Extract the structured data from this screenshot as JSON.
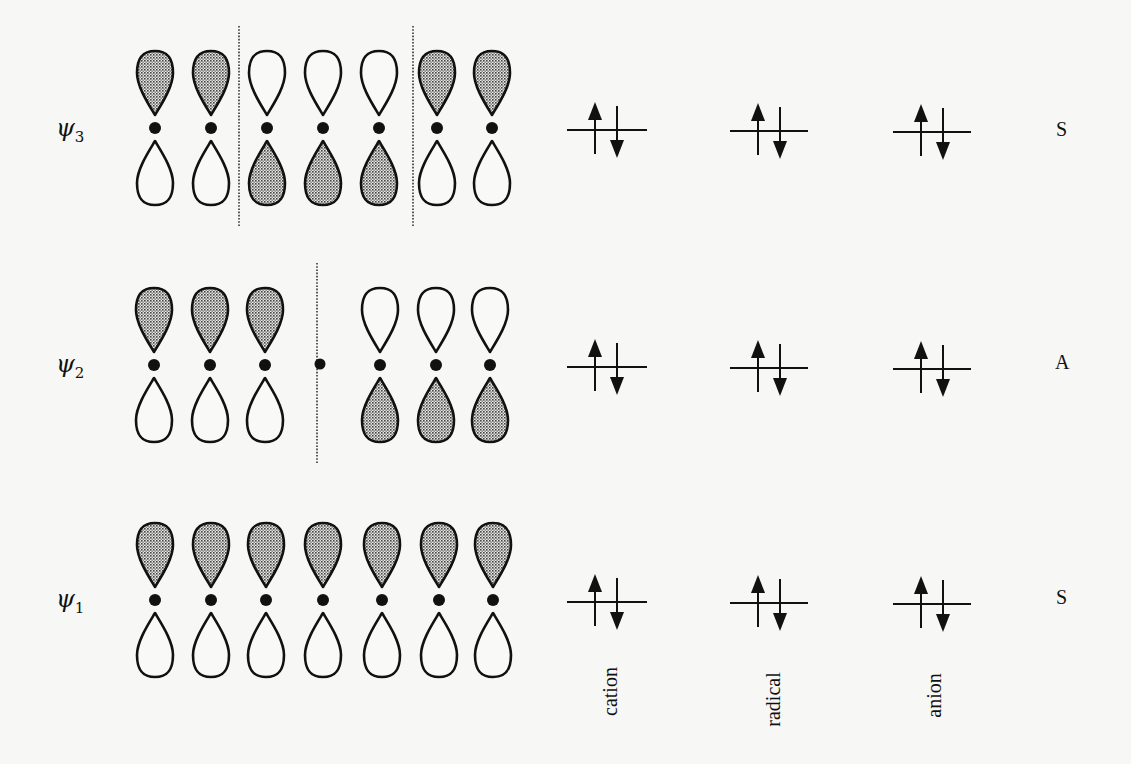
{
  "figure": {
    "colors": {
      "background": "#f7f7f5",
      "stroke": "#111111",
      "shaded_fill": "#b5b5b5"
    }
  },
  "orbitals": [
    {
      "id": "psi3",
      "label": "ψ",
      "subscript": "3",
      "symmetry": "S",
      "y_center": 128,
      "atom_x": [
        155,
        211,
        267,
        323,
        379,
        437,
        492
      ],
      "upper_shaded": [
        true,
        true,
        false,
        false,
        false,
        true,
        true
      ],
      "nodes_x": [
        239,
        413
      ],
      "node_dot_x": null,
      "occupancy": {
        "cation": "↑↓",
        "radical": "↑↓",
        "anion": "↑↓"
      }
    },
    {
      "id": "psi2",
      "label": "ψ",
      "subscript": "2",
      "symmetry": "A",
      "y_center": 365,
      "atom_x": [
        154,
        210,
        265,
        null,
        380,
        436,
        490
      ],
      "upper_shaded": [
        true,
        true,
        true,
        null,
        false,
        false,
        false
      ],
      "nodes_x": [
        317
      ],
      "node_dot_x": 320,
      "occupancy": {
        "cation": "↑↓",
        "radical": "↑↓",
        "anion": "↑↓"
      }
    },
    {
      "id": "psi1",
      "label": "ψ",
      "subscript": "1",
      "symmetry": "S",
      "y_center": 600,
      "atom_x": [
        155,
        211,
        266,
        323,
        382,
        439,
        493
      ],
      "upper_shaded": [
        true,
        true,
        true,
        true,
        true,
        true,
        true
      ],
      "nodes_x": [],
      "node_dot_x": null,
      "occupancy": {
        "cation": "↑↓",
        "radical": "↑↓",
        "anion": "↑↓"
      }
    }
  ],
  "columns": [
    {
      "key": "cation",
      "label": "cation",
      "level_x": [
        567,
        647
      ]
    },
    {
      "key": "radical",
      "label": "radical",
      "level_x": [
        730,
        808
      ]
    },
    {
      "key": "anion",
      "label": "anion",
      "level_x": [
        893,
        971
      ]
    }
  ],
  "symmetry_labels": [
    "S",
    "A",
    "S"
  ]
}
